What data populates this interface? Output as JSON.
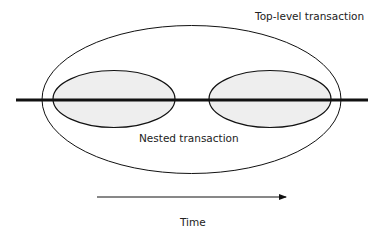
{
  "labels": {
    "top_level": "Top-level transaction",
    "nested": "Nested transaction",
    "time": "Time"
  },
  "colors": {
    "stroke": "#111111",
    "nested_fill": "#eeeeee",
    "background": "#ffffff"
  }
}
